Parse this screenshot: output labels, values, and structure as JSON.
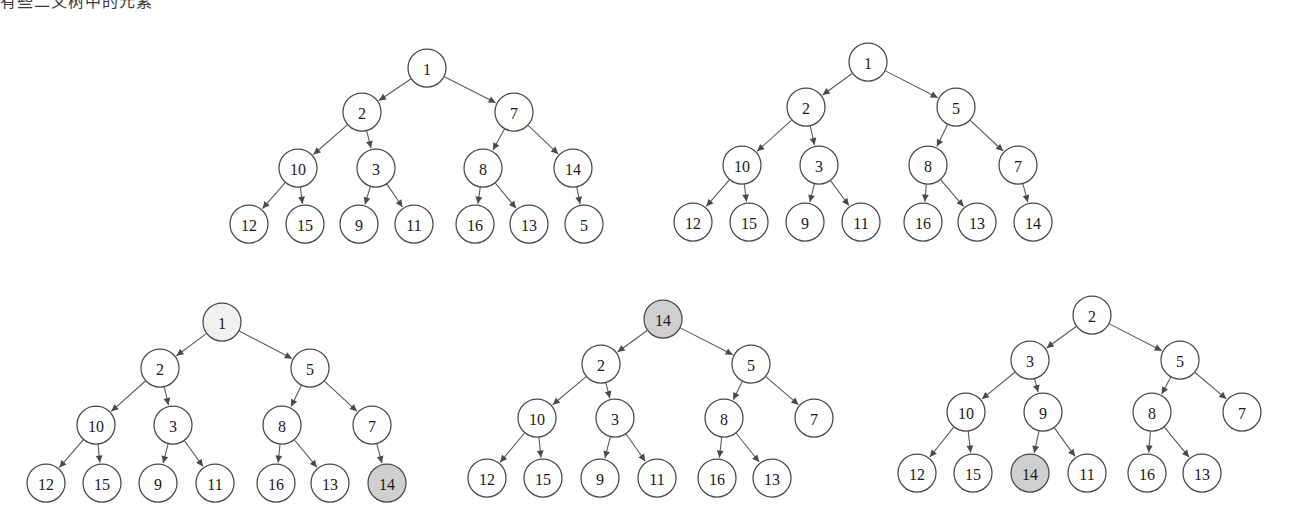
{
  "page": {
    "background_color": "#ffffff",
    "header_fragment": "有些二叉树中的元素",
    "node_stroke_color": "#4a4a4a",
    "edge_color": "#5a5a5a",
    "fill_white": "#ffffff",
    "fill_light": "#f2f1ef",
    "fill_gray": "#cfcfcf",
    "node_radius": 19
  },
  "chart_data": {
    "type": "diagram",
    "subtype": "binary-tree-array-heap",
    "highlight_legend": [
      {
        "fill": "#cfcfcf",
        "meaning": "moved / active element"
      },
      {
        "fill": "#f2f1ef",
        "meaning": "element being removed"
      },
      {
        "fill": "#ffffff",
        "meaning": "normal element"
      }
    ],
    "trees": [
      {
        "id": "tree-1",
        "position": "top-left",
        "root": 1,
        "level_order": [
          1,
          2,
          7,
          10,
          3,
          8,
          14,
          12,
          15,
          9,
          11,
          16,
          13,
          5
        ],
        "nodes": [
          {
            "id": "t1n0",
            "label": "1",
            "x": 427,
            "y": 68,
            "fill": "white",
            "level": 0
          },
          {
            "id": "t1n1",
            "label": "2",
            "x": 362,
            "y": 112,
            "fill": "white",
            "level": 1
          },
          {
            "id": "t1n2",
            "label": "7",
            "x": 514,
            "y": 112,
            "fill": "white",
            "level": 1
          },
          {
            "id": "t1n3",
            "label": "10",
            "x": 298,
            "y": 168,
            "fill": "white",
            "level": 2
          },
          {
            "id": "t1n4",
            "label": "3",
            "x": 376,
            "y": 168,
            "fill": "white",
            "level": 2
          },
          {
            "id": "t1n5",
            "label": "8",
            "x": 483,
            "y": 168,
            "fill": "white",
            "level": 2
          },
          {
            "id": "t1n6",
            "label": "14",
            "x": 573,
            "y": 168,
            "fill": "white",
            "level": 2
          },
          {
            "id": "t1n7",
            "label": "12",
            "x": 249,
            "y": 224,
            "fill": "white",
            "level": 3
          },
          {
            "id": "t1n8",
            "label": "15",
            "x": 305,
            "y": 224,
            "fill": "white",
            "level": 3
          },
          {
            "id": "t1n9",
            "label": "9",
            "x": 359,
            "y": 224,
            "fill": "white",
            "level": 3
          },
          {
            "id": "t1n10",
            "label": "11",
            "x": 414,
            "y": 224,
            "fill": "white",
            "level": 3
          },
          {
            "id": "t1n11",
            "label": "16",
            "x": 475,
            "y": 224,
            "fill": "white",
            "level": 3
          },
          {
            "id": "t1n12",
            "label": "13",
            "x": 529,
            "y": 224,
            "fill": "white",
            "level": 3
          },
          {
            "id": "t1n13",
            "label": "5",
            "x": 584,
            "y": 224,
            "fill": "white",
            "level": 3
          }
        ],
        "edges": [
          {
            "from": "t1n0",
            "to": "t1n1"
          },
          {
            "from": "t1n0",
            "to": "t1n2"
          },
          {
            "from": "t1n1",
            "to": "t1n3"
          },
          {
            "from": "t1n1",
            "to": "t1n4"
          },
          {
            "from": "t1n2",
            "to": "t1n5"
          },
          {
            "from": "t1n2",
            "to": "t1n6"
          },
          {
            "from": "t1n3",
            "to": "t1n7"
          },
          {
            "from": "t1n3",
            "to": "t1n8"
          },
          {
            "from": "t1n4",
            "to": "t1n9"
          },
          {
            "from": "t1n4",
            "to": "t1n10"
          },
          {
            "from": "t1n5",
            "to": "t1n11"
          },
          {
            "from": "t1n5",
            "to": "t1n12"
          },
          {
            "from": "t1n6",
            "to": "t1n13"
          }
        ]
      },
      {
        "id": "tree-2",
        "position": "top-right",
        "root": 1,
        "level_order": [
          1,
          2,
          5,
          10,
          3,
          8,
          7,
          12,
          15,
          9,
          11,
          16,
          13,
          14
        ],
        "nodes": [
          {
            "id": "t2n0",
            "label": "1",
            "x": 868,
            "y": 62,
            "fill": "white",
            "level": 0
          },
          {
            "id": "t2n1",
            "label": "2",
            "x": 806,
            "y": 107,
            "fill": "white",
            "level": 1
          },
          {
            "id": "t2n2",
            "label": "5",
            "x": 956,
            "y": 107,
            "fill": "white",
            "level": 1
          },
          {
            "id": "t2n3",
            "label": "10",
            "x": 742,
            "y": 165,
            "fill": "white",
            "level": 2
          },
          {
            "id": "t2n4",
            "label": "3",
            "x": 819,
            "y": 165,
            "fill": "white",
            "level": 2
          },
          {
            "id": "t2n5",
            "label": "8",
            "x": 928,
            "y": 165,
            "fill": "white",
            "level": 2
          },
          {
            "id": "t2n6",
            "label": "7",
            "x": 1018,
            "y": 165,
            "fill": "white",
            "level": 2
          },
          {
            "id": "t2n7",
            "label": "12",
            "x": 693,
            "y": 222,
            "fill": "white",
            "level": 3
          },
          {
            "id": "t2n8",
            "label": "15",
            "x": 749,
            "y": 222,
            "fill": "white",
            "level": 3
          },
          {
            "id": "t2n9",
            "label": "9",
            "x": 805,
            "y": 222,
            "fill": "white",
            "level": 3
          },
          {
            "id": "t2n10",
            "label": "11",
            "x": 861,
            "y": 222,
            "fill": "white",
            "level": 3
          },
          {
            "id": "t2n11",
            "label": "16",
            "x": 923,
            "y": 222,
            "fill": "white",
            "level": 3
          },
          {
            "id": "t2n12",
            "label": "13",
            "x": 977,
            "y": 222,
            "fill": "white",
            "level": 3
          },
          {
            "id": "t2n13",
            "label": "14",
            "x": 1033,
            "y": 222,
            "fill": "white",
            "level": 3
          }
        ],
        "edges": [
          {
            "from": "t2n0",
            "to": "t2n1"
          },
          {
            "from": "t2n0",
            "to": "t2n2"
          },
          {
            "from": "t2n1",
            "to": "t2n3"
          },
          {
            "from": "t2n1",
            "to": "t2n4"
          },
          {
            "from": "t2n2",
            "to": "t2n5"
          },
          {
            "from": "t2n2",
            "to": "t2n6"
          },
          {
            "from": "t2n3",
            "to": "t2n7"
          },
          {
            "from": "t2n3",
            "to": "t2n8"
          },
          {
            "from": "t2n4",
            "to": "t2n9"
          },
          {
            "from": "t2n4",
            "to": "t2n10"
          },
          {
            "from": "t2n5",
            "to": "t2n11"
          },
          {
            "from": "t2n5",
            "to": "t2n12"
          },
          {
            "from": "t2n6",
            "to": "t2n13"
          }
        ]
      },
      {
        "id": "tree-3",
        "position": "bottom-left",
        "root": 1,
        "level_order": [
          1,
          2,
          5,
          10,
          3,
          8,
          7,
          12,
          15,
          9,
          11,
          16,
          13,
          14
        ],
        "nodes": [
          {
            "id": "t3n0",
            "label": "1",
            "x": 222,
            "y": 322,
            "fill": "light",
            "level": 0
          },
          {
            "id": "t3n1",
            "label": "2",
            "x": 160,
            "y": 368,
            "fill": "white",
            "level": 1
          },
          {
            "id": "t3n2",
            "label": "5",
            "x": 310,
            "y": 368,
            "fill": "white",
            "level": 1
          },
          {
            "id": "t3n3",
            "label": "10",
            "x": 96,
            "y": 425,
            "fill": "white",
            "level": 2
          },
          {
            "id": "t3n4",
            "label": "3",
            "x": 173,
            "y": 425,
            "fill": "white",
            "level": 2
          },
          {
            "id": "t3n5",
            "label": "8",
            "x": 282,
            "y": 425,
            "fill": "white",
            "level": 2
          },
          {
            "id": "t3n6",
            "label": "7",
            "x": 372,
            "y": 425,
            "fill": "white",
            "level": 2
          },
          {
            "id": "t3n7",
            "label": "12",
            "x": 46,
            "y": 483,
            "fill": "white",
            "level": 3
          },
          {
            "id": "t3n8",
            "label": "15",
            "x": 102,
            "y": 483,
            "fill": "white",
            "level": 3
          },
          {
            "id": "t3n9",
            "label": "9",
            "x": 158,
            "y": 483,
            "fill": "white",
            "level": 3
          },
          {
            "id": "t3n10",
            "label": "11",
            "x": 215,
            "y": 483,
            "fill": "white",
            "level": 3
          },
          {
            "id": "t3n11",
            "label": "16",
            "x": 276,
            "y": 483,
            "fill": "white",
            "level": 3
          },
          {
            "id": "t3n12",
            "label": "13",
            "x": 330,
            "y": 483,
            "fill": "white",
            "level": 3
          },
          {
            "id": "t3n13",
            "label": "14",
            "x": 387,
            "y": 483,
            "fill": "gray",
            "level": 3
          }
        ],
        "edges": [
          {
            "from": "t3n0",
            "to": "t3n1"
          },
          {
            "from": "t3n0",
            "to": "t3n2"
          },
          {
            "from": "t3n1",
            "to": "t3n3"
          },
          {
            "from": "t3n1",
            "to": "t3n4"
          },
          {
            "from": "t3n2",
            "to": "t3n5"
          },
          {
            "from": "t3n2",
            "to": "t3n6"
          },
          {
            "from": "t3n3",
            "to": "t3n7"
          },
          {
            "from": "t3n3",
            "to": "t3n8"
          },
          {
            "from": "t3n4",
            "to": "t3n9"
          },
          {
            "from": "t3n4",
            "to": "t3n10"
          },
          {
            "from": "t3n5",
            "to": "t3n11"
          },
          {
            "from": "t3n5",
            "to": "t3n12"
          },
          {
            "from": "t3n6",
            "to": "t3n13"
          }
        ]
      },
      {
        "id": "tree-4",
        "position": "bottom-middle",
        "root": 14,
        "level_order": [
          14,
          2,
          5,
          10,
          3,
          8,
          7,
          12,
          15,
          9,
          11,
          16,
          13
        ],
        "nodes": [
          {
            "id": "t4n0",
            "label": "14",
            "x": 663,
            "y": 319,
            "fill": "gray",
            "level": 0
          },
          {
            "id": "t4n1",
            "label": "2",
            "x": 601,
            "y": 364,
            "fill": "white",
            "level": 1
          },
          {
            "id": "t4n2",
            "label": "5",
            "x": 751,
            "y": 364,
            "fill": "white",
            "level": 1
          },
          {
            "id": "t4n3",
            "label": "10",
            "x": 537,
            "y": 418,
            "fill": "white",
            "level": 2
          },
          {
            "id": "t4n4",
            "label": "3",
            "x": 615,
            "y": 418,
            "fill": "white",
            "level": 2
          },
          {
            "id": "t4n5",
            "label": "8",
            "x": 724,
            "y": 418,
            "fill": "white",
            "level": 2
          },
          {
            "id": "t4n6",
            "label": "7",
            "x": 814,
            "y": 418,
            "fill": "white",
            "level": 2
          },
          {
            "id": "t4n7",
            "label": "12",
            "x": 487,
            "y": 478,
            "fill": "white",
            "level": 3
          },
          {
            "id": "t4n8",
            "label": "15",
            "x": 543,
            "y": 478,
            "fill": "white",
            "level": 3
          },
          {
            "id": "t4n9",
            "label": "9",
            "x": 600,
            "y": 478,
            "fill": "white",
            "level": 3
          },
          {
            "id": "t4n10",
            "label": "11",
            "x": 657,
            "y": 478,
            "fill": "white",
            "level": 3
          },
          {
            "id": "t4n11",
            "label": "16",
            "x": 717,
            "y": 478,
            "fill": "white",
            "level": 3
          },
          {
            "id": "t4n12",
            "label": "13",
            "x": 772,
            "y": 478,
            "fill": "white",
            "level": 3
          }
        ],
        "edges": [
          {
            "from": "t4n0",
            "to": "t4n1"
          },
          {
            "from": "t4n0",
            "to": "t4n2"
          },
          {
            "from": "t4n1",
            "to": "t4n3"
          },
          {
            "from": "t4n1",
            "to": "t4n4"
          },
          {
            "from": "t4n2",
            "to": "t4n5"
          },
          {
            "from": "t4n2",
            "to": "t4n6"
          },
          {
            "from": "t4n3",
            "to": "t4n7"
          },
          {
            "from": "t4n3",
            "to": "t4n8"
          },
          {
            "from": "t4n4",
            "to": "t4n9"
          },
          {
            "from": "t4n4",
            "to": "t4n10"
          },
          {
            "from": "t4n5",
            "to": "t4n11"
          },
          {
            "from": "t4n5",
            "to": "t4n12"
          }
        ]
      },
      {
        "id": "tree-5",
        "position": "bottom-right",
        "root": 2,
        "level_order": [
          2,
          3,
          5,
          10,
          9,
          8,
          7,
          12,
          15,
          14,
          11,
          16,
          13
        ],
        "nodes": [
          {
            "id": "t5n0",
            "label": "2",
            "x": 1092,
            "y": 315,
            "fill": "white",
            "level": 0
          },
          {
            "id": "t5n1",
            "label": "3",
            "x": 1030,
            "y": 360,
            "fill": "white",
            "level": 1
          },
          {
            "id": "t5n2",
            "label": "5",
            "x": 1180,
            "y": 360,
            "fill": "white",
            "level": 1
          },
          {
            "id": "t5n3",
            "label": "10",
            "x": 966,
            "y": 412,
            "fill": "white",
            "level": 2
          },
          {
            "id": "t5n4",
            "label": "9",
            "x": 1043,
            "y": 412,
            "fill": "white",
            "level": 2
          },
          {
            "id": "t5n5",
            "label": "8",
            "x": 1152,
            "y": 412,
            "fill": "white",
            "level": 2
          },
          {
            "id": "t5n6",
            "label": "7",
            "x": 1242,
            "y": 412,
            "fill": "white",
            "level": 2
          },
          {
            "id": "t5n7",
            "label": "12",
            "x": 917,
            "y": 473,
            "fill": "white",
            "level": 3
          },
          {
            "id": "t5n8",
            "label": "15",
            "x": 973,
            "y": 473,
            "fill": "white",
            "level": 3
          },
          {
            "id": "t5n9",
            "label": "14",
            "x": 1030,
            "y": 473,
            "fill": "gray",
            "level": 3
          },
          {
            "id": "t5n10",
            "label": "11",
            "x": 1087,
            "y": 473,
            "fill": "white",
            "level": 3
          },
          {
            "id": "t5n11",
            "label": "16",
            "x": 1147,
            "y": 473,
            "fill": "white",
            "level": 3
          },
          {
            "id": "t5n12",
            "label": "13",
            "x": 1202,
            "y": 473,
            "fill": "white",
            "level": 3
          }
        ],
        "edges": [
          {
            "from": "t5n0",
            "to": "t5n1"
          },
          {
            "from": "t5n0",
            "to": "t5n2"
          },
          {
            "from": "t5n1",
            "to": "t5n3"
          },
          {
            "from": "t5n1",
            "to": "t5n4"
          },
          {
            "from": "t5n2",
            "to": "t5n5"
          },
          {
            "from": "t5n2",
            "to": "t5n6"
          },
          {
            "from": "t5n3",
            "to": "t5n7"
          },
          {
            "from": "t5n3",
            "to": "t5n8"
          },
          {
            "from": "t5n4",
            "to": "t5n9"
          },
          {
            "from": "t5n4",
            "to": "t5n10"
          },
          {
            "from": "t5n5",
            "to": "t5n11"
          },
          {
            "from": "t5n5",
            "to": "t5n12"
          }
        ]
      }
    ]
  }
}
